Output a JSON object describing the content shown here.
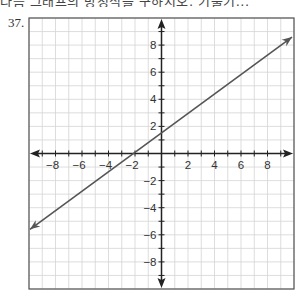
{
  "header": {
    "clipped_text": "다음 그래프의 방정식을 구하시오. 기울기..."
  },
  "problem": {
    "number": "37."
  },
  "colors": {
    "grid": "#d4d4d4",
    "axes": "#222222",
    "border": "#555555",
    "line": "#555555"
  },
  "chart_data": {
    "type": "line",
    "title": "",
    "xlabel": "",
    "ylabel": "",
    "xlim": [
      -10,
      10
    ],
    "ylim": [
      -10,
      10
    ],
    "grid": true,
    "grid_step": 1,
    "x_tick_labels": [
      "-8",
      "-6",
      "-4",
      "-2",
      "2",
      "4",
      "6",
      "8"
    ],
    "x_ticks": [
      -8,
      -6,
      -4,
      -2,
      2,
      4,
      6,
      8
    ],
    "y_tick_labels": [
      "8",
      "6",
      "4",
      "2",
      "-2",
      "-4",
      "-6",
      "-8"
    ],
    "y_ticks": [
      8,
      6,
      4,
      2,
      -2,
      -4,
      -6,
      -8
    ],
    "axes_arrows": true,
    "series": [
      {
        "name": "line",
        "equation": "y = (3/4)x + 3/2",
        "slope": 0.75,
        "intercept": 1.5,
        "x": [
          -10,
          -2,
          0,
          2,
          6,
          10
        ],
        "y": [
          -6,
          0,
          1.5,
          3,
          6,
          9
        ],
        "arrows_both_ends": true
      }
    ]
  }
}
